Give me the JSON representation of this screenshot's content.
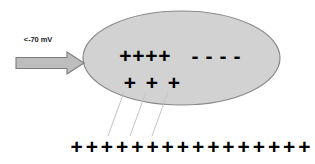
{
  "figure": {
    "background_color": "#ffffff"
  },
  "stimulus": {
    "label": "<-70 mV",
    "arrow_icon": "right-block-arrow-icon",
    "arrow_fill": "#bdbdbd",
    "arrow_stroke": "#7d7d7d",
    "direction": "right"
  },
  "cell": {
    "shape": "ellipse",
    "fill_color": "#d2d2d2",
    "border_color": "#8a8a8a",
    "cx": 181.5,
    "cy": 58,
    "rx": 98.5,
    "ry": 47
  },
  "charges": {
    "inner_positive_top": {
      "symbol": "+",
      "count": 4,
      "symbols": [
        "+",
        "+",
        "+",
        "+"
      ],
      "color": "#000000"
    },
    "inner_negative_top": {
      "symbol": "-",
      "count": 4,
      "symbols": [
        "-",
        "-",
        "-",
        "-"
      ],
      "color": "#000000"
    },
    "inner_positive_bottom": {
      "symbol": "+",
      "count": 3,
      "symbols": [
        "+",
        "+",
        "+"
      ],
      "color": "#000000"
    },
    "outer_positive_row": {
      "symbol": "+",
      "count": 16,
      "symbols": [
        "+",
        "+",
        "+",
        "+",
        "+",
        "+",
        "+",
        "+",
        "+",
        "+",
        "+",
        "+",
        "+",
        "+",
        "+",
        "+"
      ],
      "color": "#000000"
    }
  },
  "connectors": {
    "line_color": "#c4c4c4",
    "count": 3,
    "lines": [
      {
        "x1": 124,
        "y1": 92,
        "x2": 108,
        "y2": 136
      },
      {
        "x1": 146,
        "y1": 92,
        "x2": 130,
        "y2": 136
      },
      {
        "x1": 168,
        "y1": 92,
        "x2": 152,
        "y2": 136
      }
    ]
  }
}
